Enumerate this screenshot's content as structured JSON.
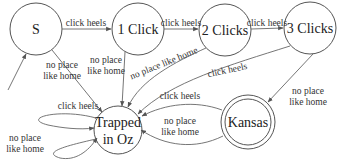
{
  "diagram": {
    "type": "finite-state-machine",
    "states": [
      {
        "id": "S",
        "label": "S",
        "start": true,
        "accepting": false
      },
      {
        "id": "one",
        "label": "1 Click",
        "start": false,
        "accepting": false
      },
      {
        "id": "two",
        "label": "2 Clicks",
        "start": false,
        "accepting": false
      },
      {
        "id": "three",
        "label": "3 Clicks",
        "start": false,
        "accepting": false
      },
      {
        "id": "oz",
        "label_line1": "Trapped",
        "label_line2": "in Oz",
        "start": false,
        "accepting": false
      },
      {
        "id": "kansas",
        "label": "Kansas",
        "start": false,
        "accepting": true
      }
    ],
    "edges": [
      {
        "from": "S",
        "to": "one",
        "label": "click heels"
      },
      {
        "from": "one",
        "to": "two",
        "label": "click heels"
      },
      {
        "from": "two",
        "to": "three",
        "label": "click heels"
      },
      {
        "from": "S",
        "to": "oz",
        "label_line1": "no place",
        "label_line2": "like home"
      },
      {
        "from": "one",
        "to": "oz",
        "label_line1": "no place",
        "label_line2": "like home"
      },
      {
        "from": "two",
        "to": "oz",
        "label": "no place like home"
      },
      {
        "from": "three",
        "to": "oz",
        "label": "click heels"
      },
      {
        "from": "three",
        "to": "kansas",
        "label_line1": "no place",
        "label_line2": "like home"
      },
      {
        "from": "kansas",
        "to": "oz",
        "label": "click heels"
      },
      {
        "from": "kansas",
        "to": "oz",
        "label_line1": "no place",
        "label_line2": "like home",
        "variant": "lower"
      },
      {
        "from": "oz",
        "to": "oz",
        "label": "click heels",
        "variant": "self-loop-upper"
      },
      {
        "from": "oz",
        "to": "oz",
        "label_line1": "no place",
        "label_line2": "like home",
        "variant": "self-loop-lower"
      }
    ]
  }
}
